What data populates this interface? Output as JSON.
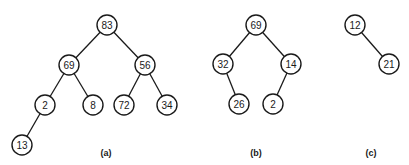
{
  "diagram": {
    "node_radius": 10,
    "colors": {
      "stroke": "#1a1a1a",
      "fill": "#ffffff",
      "background": "#ffffff"
    },
    "trees": [
      {
        "id": "a",
        "caption": "(a)",
        "caption_pos": [
          106,
          153
        ],
        "nodes": [
          {
            "id": "a83",
            "label": "83",
            "x": 107,
            "y": 25
          },
          {
            "id": "a69",
            "label": "69",
            "x": 69,
            "y": 65
          },
          {
            "id": "a56",
            "label": "56",
            "x": 145,
            "y": 65
          },
          {
            "id": "a2",
            "label": "2",
            "x": 45,
            "y": 105
          },
          {
            "id": "a8",
            "label": "8",
            "x": 93,
            "y": 105
          },
          {
            "id": "a72",
            "label": "72",
            "x": 124,
            "y": 105
          },
          {
            "id": "a34",
            "label": "34",
            "x": 167,
            "y": 105
          },
          {
            "id": "a13",
            "label": "13",
            "x": 22,
            "y": 145
          }
        ],
        "edges": [
          [
            "a83",
            "a69"
          ],
          [
            "a83",
            "a56"
          ],
          [
            "a69",
            "a2"
          ],
          [
            "a69",
            "a8"
          ],
          [
            "a56",
            "a72"
          ],
          [
            "a56",
            "a34"
          ],
          [
            "a2",
            "a13"
          ]
        ]
      },
      {
        "id": "b",
        "caption": "(b)",
        "caption_pos": [
          256,
          153
        ],
        "nodes": [
          {
            "id": "b69",
            "label": "69",
            "x": 256,
            "y": 25
          },
          {
            "id": "b32",
            "label": "32",
            "x": 223,
            "y": 64
          },
          {
            "id": "b14",
            "label": "14",
            "x": 291,
            "y": 64
          },
          {
            "id": "b26",
            "label": "26",
            "x": 239,
            "y": 104
          },
          {
            "id": "b2",
            "label": "2",
            "x": 273,
            "y": 104
          }
        ],
        "edges": [
          [
            "b69",
            "b32"
          ],
          [
            "b69",
            "b14"
          ],
          [
            "b32",
            "b26"
          ],
          [
            "b14",
            "b2"
          ]
        ]
      },
      {
        "id": "c",
        "caption": "(c)",
        "caption_pos": [
          371,
          153
        ],
        "nodes": [
          {
            "id": "c12",
            "label": "12",
            "x": 355,
            "y": 25
          },
          {
            "id": "c21",
            "label": "21",
            "x": 389,
            "y": 64
          }
        ],
        "edges": [
          [
            "c12",
            "c21"
          ]
        ]
      }
    ]
  }
}
